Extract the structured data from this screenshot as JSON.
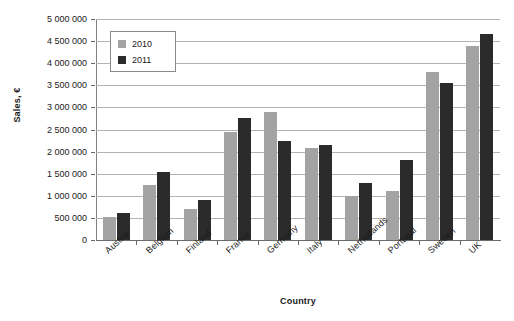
{
  "chart_data": {
    "type": "bar",
    "title": "",
    "xlabel": "Country",
    "ylabel": "Sales, €",
    "categories": [
      "Austria",
      "Belgium",
      "Finland",
      "France",
      "Germany",
      "Italy",
      "Netherlands",
      "Portugal",
      "Sweden",
      "UK"
    ],
    "series": [
      {
        "name": "2010",
        "color": "#a3a3a3",
        "values": [
          510000,
          1250000,
          710000,
          2450000,
          2900000,
          2080000,
          1000000,
          1100000,
          3800000,
          4400000
        ]
      },
      {
        "name": "2011",
        "color": "#2b2b2b",
        "values": [
          610000,
          1550000,
          910000,
          2750000,
          2250000,
          2150000,
          1300000,
          1800000,
          3550000,
          4650000
        ]
      }
    ],
    "ylim": [
      0,
      5000000
    ],
    "ytick_step": 500000,
    "ytick_labels": [
      "0",
      "500 000",
      "1 000 000",
      "1 500 000",
      "2 000 000",
      "2 500 000",
      "3 000 000",
      "3 500 000",
      "4 000 000",
      "4 500 000",
      "5 000 000"
    ],
    "ytick_values": [
      0,
      500000,
      1000000,
      1500000,
      2000000,
      2500000,
      3000000,
      3500000,
      4000000,
      4500000,
      5000000
    ],
    "grid": true,
    "legend_position": "upper-left-inside",
    "legend_entries": [
      "2010",
      "2011"
    ]
  }
}
